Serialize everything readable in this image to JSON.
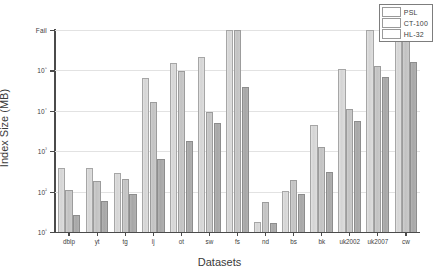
{
  "chart_data": {
    "type": "bar",
    "title": "",
    "subtitle": "",
    "xlabel": "Datasets",
    "ylabel": "Index Size (MB)",
    "yscale": "log",
    "ylim": [
      10,
      1000000
    ],
    "grid": true,
    "legend_position": "top-right",
    "ytick_labels": [
      "10¹",
      "10²",
      "10³",
      "10⁴",
      "10⁵",
      "Fail"
    ],
    "ytick_values": [
      10,
      100,
      1000,
      10000,
      100000,
      1000000
    ],
    "fail_note": "Bars reaching the top 'Fail' level indicate the method failed to build an index",
    "categories": [
      "dblp",
      "yt",
      "tg",
      "lj",
      "ot",
      "sw",
      "fs",
      "nd",
      "bs",
      "bk",
      "uk2002",
      "uk2007",
      "cw"
    ],
    "series": [
      {
        "name": "PSL",
        "color": "#dcdcdc",
        "values": [
          380,
          385,
          290,
          65000,
          150000,
          215000,
          1000000,
          18,
          105,
          4400,
          110000,
          1000000,
          1000000
        ],
        "fail_flags": [
          false,
          false,
          false,
          false,
          false,
          false,
          true,
          false,
          false,
          false,
          false,
          true,
          true
        ]
      },
      {
        "name": "CT-100",
        "color": "#c8c8c8",
        "values": [
          110,
          185,
          210,
          17000,
          97000,
          9500,
          1000000,
          55,
          190,
          1250,
          11000,
          130000,
          1000000
        ],
        "fail_flags": [
          false,
          false,
          false,
          false,
          false,
          false,
          true,
          false,
          false,
          false,
          false,
          false,
          true
        ]
      },
      {
        "name": "HL-32",
        "color": "#aeaeae",
        "values": [
          27,
          60,
          86,
          660,
          1750,
          4900,
          39000,
          17,
          85,
          300,
          5500,
          70000,
          165000
        ],
        "fail_flags": [
          false,
          false,
          false,
          false,
          false,
          false,
          false,
          false,
          false,
          false,
          false,
          false,
          false
        ]
      }
    ]
  },
  "legend": {
    "entries": [
      {
        "label": "PSL"
      },
      {
        "label": "CT-100"
      },
      {
        "label": "HL-32"
      }
    ]
  },
  "axes": {
    "y_title": "Index Size (MB)",
    "x_title": "Datasets"
  }
}
